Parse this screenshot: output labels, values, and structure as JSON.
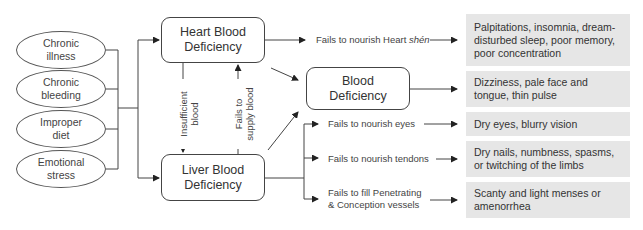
{
  "causes": [
    {
      "line1": "Chronic",
      "line2": "illness"
    },
    {
      "line1": "Chronic",
      "line2": "bleeding"
    },
    {
      "line1": "Improper",
      "line2": "diet"
    },
    {
      "line1": "Emotional",
      "line2": "stress"
    }
  ],
  "nodes": {
    "heart": {
      "line1": "Heart Blood",
      "line2": "Deficiency"
    },
    "liver": {
      "line1": "Liver Blood",
      "line2": "Deficiency"
    },
    "blood": {
      "line1": "Blood",
      "line2": "Deficiency"
    }
  },
  "vertical_labels": {
    "heart_to_liver": {
      "line1": "Insufficient",
      "line2": "blood"
    },
    "liver_to_heart": {
      "line1": "Fails to",
      "line2": "supply blood"
    }
  },
  "pathways": {
    "heart_shen": {
      "text": "Fails to nourish Heart ",
      "italic": "shén"
    },
    "eyes": "Fails to nourish eyes",
    "tendons": "Fails to nourish tendons",
    "vessels_line1": "Fails to fill Penetrating",
    "vessels_line2": "& Conception vessels"
  },
  "symptoms": [
    "Palpitations, insomnia, dream-disturbed sleep, poor memory, poor concentration",
    "Dizziness, pale face and tongue, thin pulse",
    "Dry eyes, blurry vision",
    "Dry nails, numbness, spasms, or twitching of the limbs",
    "Scanty and light menses or amenorrhea"
  ],
  "colors": {
    "line": "#333333",
    "symptom_bg": "#e6e6e6"
  }
}
